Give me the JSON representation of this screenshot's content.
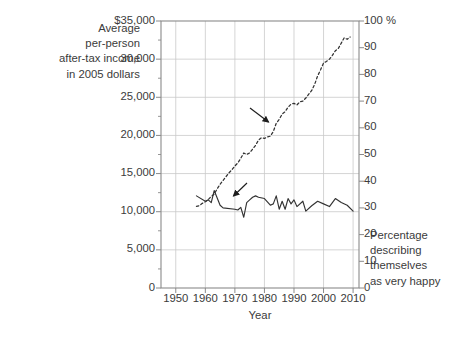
{
  "chart_data": {
    "type": "line",
    "title": "",
    "xlabel": "Year",
    "ylabel_left": "Average\nper-person\nafter-tax income\nin 2005 dollars",
    "ylabel_right": "Percentage\ndescribing\nthemselves\nas very happy",
    "right_axis_unit": "100 %",
    "xlim": [
      1945,
      2012
    ],
    "xticks": [
      1950,
      1960,
      1970,
      1980,
      1990,
      2000,
      2010
    ],
    "xtick_labels": [
      "1950",
      "1960",
      "1970",
      "1980",
      "1990",
      "2000",
      "2010"
    ],
    "ylim_left": [
      0,
      35000
    ],
    "yticks_left": [
      0,
      5000,
      10000,
      15000,
      20000,
      25000,
      30000,
      35000
    ],
    "ytick_labels_left": [
      "0",
      "5,000",
      "10,000",
      "15,000",
      "20,000",
      "25,000",
      "30,000",
      "$35,000"
    ],
    "ylim_right": [
      0,
      100
    ],
    "yticks_right": [
      0,
      10,
      20,
      30,
      40,
      50,
      60,
      70,
      80,
      90,
      100
    ],
    "ytick_labels_right": [
      "0",
      "10",
      "20",
      "30",
      "40",
      "50",
      "60",
      "70",
      "80",
      "90",
      "100 %"
    ],
    "grid": true,
    "legend": "none",
    "annotations": [
      {
        "text": "Personal income",
        "x": 1973,
        "y": 24500,
        "arrow_to_x": 1985,
        "arrow_to_y": 22300
      },
      {
        "text": "Percentage very happy",
        "x": 1981,
        "y": 15000,
        "arrow_to_x": 1978,
        "arrow_to_y": 11800
      }
    ],
    "series": [
      {
        "name": "Personal income",
        "axis": "left",
        "style": "dashed",
        "color": "#333333",
        "unit": "2005 dollars",
        "x": [
          1957,
          1958,
          1959,
          1960,
          1961,
          1962,
          1963,
          1964,
          1965,
          1966,
          1967,
          1968,
          1969,
          1970,
          1971,
          1972,
          1973,
          1974,
          1975,
          1976,
          1977,
          1978,
          1979,
          1980,
          1981,
          1982,
          1983,
          1984,
          1985,
          1986,
          1987,
          1988,
          1989,
          1990,
          1991,
          1992,
          1993,
          1994,
          1995,
          1996,
          1997,
          1998,
          1999,
          2000,
          2001,
          2002,
          2003,
          2004,
          2005,
          2006,
          2007,
          2008,
          2009
        ],
        "y": [
          10700,
          10800,
          11100,
          11300,
          11600,
          12000,
          12300,
          13000,
          13600,
          14100,
          14600,
          15100,
          15500,
          16000,
          16400,
          17000,
          17700,
          17500,
          17700,
          18200,
          18700,
          19400,
          19700,
          19600,
          19800,
          19900,
          20500,
          21600,
          22100,
          22800,
          23100,
          23700,
          24100,
          24200,
          24000,
          24400,
          24500,
          24900,
          25400,
          25900,
          26700,
          27800,
          28600,
          29500,
          29700,
          30000,
          30500,
          31100,
          31400,
          32100,
          32800,
          32600,
          32900
        ]
      },
      {
        "name": "Percentage very happy",
        "axis": "right",
        "style": "solid",
        "color": "#333333",
        "unit": "percent",
        "x": [
          1957,
          1960,
          1961,
          1962,
          1963,
          1965,
          1966,
          1970,
          1971,
          1972,
          1973,
          1974,
          1975,
          1976,
          1977,
          1978,
          1980,
          1982,
          1983,
          1984,
          1985,
          1986,
          1987,
          1988,
          1989,
          1990,
          1991,
          1993,
          1994,
          1996,
          1998,
          2000,
          2002,
          2004,
          2006,
          2008,
          2010
        ],
        "y": [
          34.5,
          32.5,
          33.0,
          32.0,
          36.5,
          31.0,
          30.0,
          29.5,
          29.2,
          30.2,
          26.5,
          32.0,
          33.0,
          34.0,
          34.5,
          34.0,
          33.5,
          31.0,
          31.5,
          34.5,
          29.5,
          32.5,
          29.5,
          33.5,
          31.5,
          33.0,
          30.5,
          32.5,
          28.8,
          30.8,
          32.5,
          31.5,
          30.5,
          33.5,
          32.0,
          31.0,
          28.8
        ]
      }
    ]
  },
  "axis_title_left": "Average\nper-person\nafter-tax income\nin 2005 dollars",
  "axis_caption_right": "Percentage\ndescribing\nthemselves\nas very happy",
  "xaxis_label": "Year",
  "annotations": {
    "income": "Personal income",
    "happy": "Percentage very happy"
  },
  "colors": {
    "text": "#3b3b3b",
    "gridline": "#c9c9c9",
    "axis_border": "#8a8a8a",
    "data_line": "#333333",
    "background": "#ffffff"
  }
}
